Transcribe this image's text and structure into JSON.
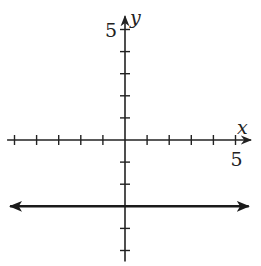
{
  "chart_data": {
    "type": "line",
    "title": "",
    "xlabel": "x",
    "ylabel": "y",
    "xlim": [
      -5.2,
      5.7
    ],
    "ylim": [
      -5.5,
      5.6
    ],
    "x_tick_step": 1,
    "y_tick_step": 1,
    "x_tick_labels": [
      {
        "value": 5,
        "text": "5"
      }
    ],
    "y_tick_labels": [
      {
        "value": 5,
        "text": "5"
      }
    ],
    "grid": false,
    "series": [
      {
        "name": "y = -3",
        "equation": "y = -3",
        "kind": "horizontal-line",
        "x": [
          -5.2,
          5.6
        ],
        "y": [
          -3,
          -3
        ],
        "arrows": "both-ends",
        "color": "#1a1a1a"
      }
    ],
    "axis_color": "#222222"
  }
}
